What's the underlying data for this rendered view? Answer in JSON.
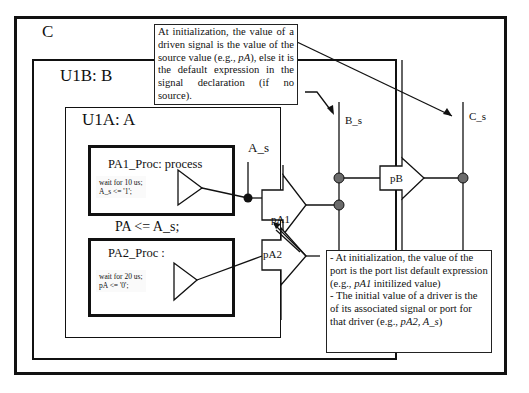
{
  "diagram": {
    "outer_block": {
      "label": "C"
    },
    "block_b": {
      "label": "U1B: B"
    },
    "block_a": {
      "label": "U1A: A"
    },
    "process1": {
      "title": "PA1_Proc: process",
      "code_line1": "wait for 10 us;",
      "code_line2": "A_s <= '1';"
    },
    "process2": {
      "title": "PA2_Proc :",
      "code_line1": "wait for 20 us;",
      "code_line2": "pA <= '0';"
    },
    "assignment": "PA <= A_s;",
    "signals": {
      "a_s": "A_s",
      "b_s": "B_s",
      "c_s": "C_s"
    },
    "ports": {
      "pa1": "pA1",
      "pa2": "pA2",
      "pb": "pB"
    },
    "note_top": {
      "text_before": "At initialization, the value of a driven signal  is the value of the source value (e.g., ",
      "italic": "pA",
      "text_after": "), else it is the default expression in the signal declaration (if no source)."
    },
    "note_bottom": {
      "p1_before": " - At initialization, the value of the port is the port list default expression (e.g., ",
      "p1_italic": "pA1",
      "p1_after": " initilized value)",
      "p2_before": " - The initial value of a driver is the of its associated signal or port for that driver (e.g., ",
      "p2_italic": "pA2, A_s",
      "p2_after": ")"
    },
    "colors": {
      "line": "#111111",
      "junction_dark": "#111111",
      "junction_gray": "#6b6b6b"
    }
  }
}
